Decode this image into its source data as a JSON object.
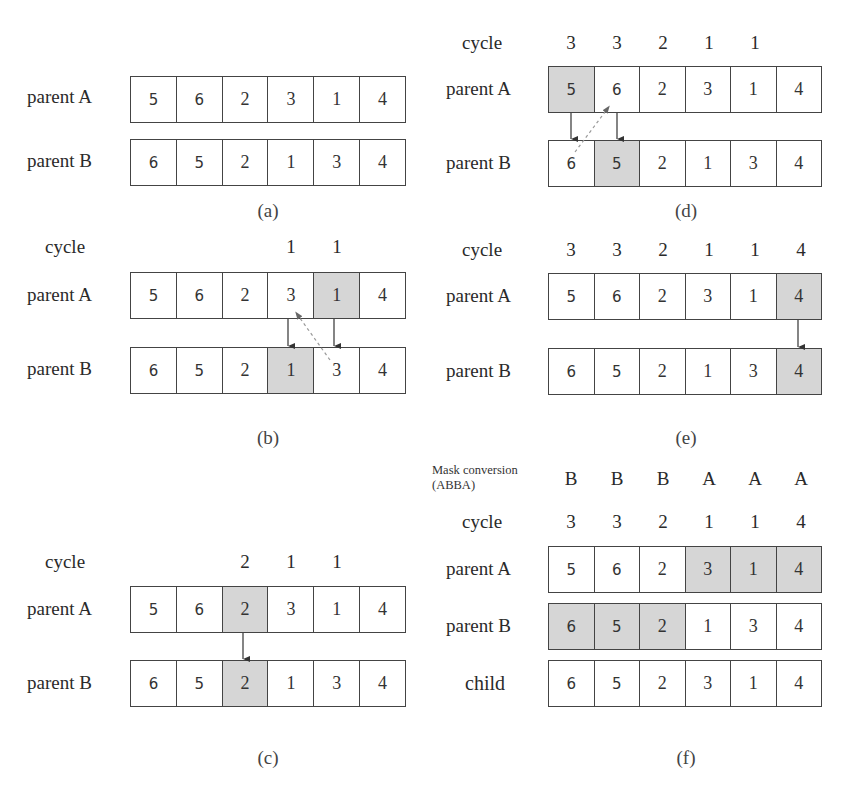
{
  "row_labels": {
    "parent_a": "parent A",
    "parent_b": "parent B",
    "child": "child",
    "cycle": "cycle"
  },
  "mask_label": {
    "line1": "Mask conversion",
    "line2": "(ABBA)"
  },
  "panels": {
    "a": {
      "caption": "(a)",
      "parent_a": [
        "5",
        "6",
        "2",
        "3",
        "1",
        "4"
      ],
      "parent_b": [
        "6",
        "5",
        "2",
        "1",
        "3",
        "4"
      ]
    },
    "b": {
      "caption": "(b)",
      "cycle": [
        "",
        "",
        "",
        "1",
        "1",
        ""
      ],
      "parent_a": [
        "5",
        "6",
        "2",
        "3",
        "1",
        "4"
      ],
      "parent_b": [
        "6",
        "5",
        "2",
        "1",
        "3",
        "4"
      ],
      "shaded_a": [
        4
      ],
      "shaded_b": [
        3
      ]
    },
    "c": {
      "caption": "(c)",
      "cycle": [
        "",
        "",
        "2",
        "1",
        "1",
        ""
      ],
      "parent_a": [
        "5",
        "6",
        "2",
        "3",
        "1",
        "4"
      ],
      "parent_b": [
        "6",
        "5",
        "2",
        "1",
        "3",
        "4"
      ],
      "shaded_a": [
        2
      ],
      "shaded_b": [
        2
      ]
    },
    "d": {
      "caption": "(d)",
      "cycle": [
        "3",
        "3",
        "2",
        "1",
        "1",
        ""
      ],
      "parent_a": [
        "5",
        "6",
        "2",
        "3",
        "1",
        "4"
      ],
      "parent_b": [
        "6",
        "5",
        "2",
        "1",
        "3",
        "4"
      ],
      "shaded_a": [
        0
      ],
      "shaded_b": [
        1
      ]
    },
    "e": {
      "caption": "(e)",
      "cycle": [
        "3",
        "3",
        "2",
        "1",
        "1",
        "4"
      ],
      "parent_a": [
        "5",
        "6",
        "2",
        "3",
        "1",
        "4"
      ],
      "parent_b": [
        "6",
        "5",
        "2",
        "1",
        "3",
        "4"
      ],
      "shaded_a": [
        5
      ],
      "shaded_b": [
        5
      ]
    },
    "f": {
      "caption": "(f)",
      "mask": [
        "B",
        "B",
        "B",
        "A",
        "A",
        "A"
      ],
      "cycle": [
        "3",
        "3",
        "2",
        "1",
        "1",
        "4"
      ],
      "parent_a": [
        "5",
        "6",
        "2",
        "3",
        "1",
        "4"
      ],
      "parent_b": [
        "6",
        "5",
        "2",
        "1",
        "3",
        "4"
      ],
      "child": [
        "6",
        "5",
        "2",
        "3",
        "1",
        "4"
      ],
      "shaded_a": [
        3,
        4,
        5
      ],
      "shaded_b": [
        0,
        1,
        2
      ]
    }
  },
  "colors": {
    "shade": "#d6d6d6",
    "border": "#444444",
    "dashed_arrow": "#999999"
  }
}
